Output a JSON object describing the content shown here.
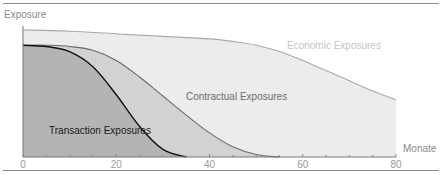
{
  "chart_data": {
    "type": "area",
    "title": "",
    "xlabel": "Monate",
    "ylabel": "Exposure",
    "xlim": [
      0,
      80
    ],
    "ylim": [
      0,
      1
    ],
    "x_ticks": [
      "0",
      "20",
      "40",
      "60",
      "80"
    ],
    "minor_tick_step": 5,
    "grid": false,
    "legend": "inline labels",
    "series": [
      {
        "name": "Economic Exposures",
        "fill": "#ececec",
        "stroke": "#a8a8a8",
        "x": [
          0,
          10,
          20,
          30,
          40,
          45,
          50,
          55,
          60,
          65,
          70,
          75,
          80
        ],
        "values": [
          1.0,
          0.99,
          0.97,
          0.95,
          0.93,
          0.91,
          0.88,
          0.83,
          0.76,
          0.68,
          0.6,
          0.52,
          0.45
        ]
      },
      {
        "name": "Contractual Exposures",
        "fill": "#d2d2d2",
        "stroke": "#6a6a6a",
        "x": [
          0,
          5,
          10,
          15,
          20,
          25,
          30,
          35,
          40,
          45,
          50,
          55
        ],
        "values": [
          0.88,
          0.88,
          0.87,
          0.84,
          0.76,
          0.63,
          0.48,
          0.33,
          0.19,
          0.08,
          0.02,
          0.0
        ]
      },
      {
        "name": "Transaction Exposures",
        "fill": "#b4b4b4",
        "stroke": "#111111",
        "x": [
          0,
          5,
          10,
          15,
          20,
          25,
          30,
          35
        ],
        "values": [
          0.88,
          0.87,
          0.83,
          0.71,
          0.49,
          0.24,
          0.06,
          0.0
        ]
      }
    ],
    "labels": {
      "economic": "Economic Exposures",
      "contractual": "Contractual Exposures",
      "transaction": "Transaction Exposures"
    }
  }
}
